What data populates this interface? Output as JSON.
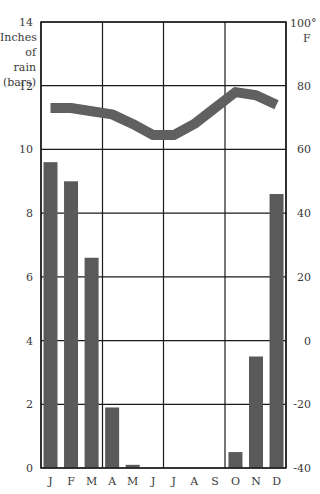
{
  "chart_data": {
    "type": "bar+line",
    "title": "",
    "categories": [
      "J",
      "F",
      "M",
      "A",
      "M",
      "J",
      "J",
      "A",
      "S",
      "O",
      "N",
      "D"
    ],
    "series": [
      {
        "name": "Inches of rain (bars)",
        "type": "bar",
        "axis": "left",
        "values": [
          9.6,
          9.0,
          6.6,
          1.9,
          0.1,
          0,
          0,
          0,
          0,
          0.5,
          3.5,
          8.6
        ]
      },
      {
        "name": "Temperature °F",
        "type": "line",
        "axis": "right",
        "values": [
          73,
          73,
          72,
          71,
          68,
          64.5,
          64.5,
          68,
          73,
          78,
          77,
          74
        ]
      }
    ],
    "left_axis": {
      "label_lines": [
        "Inches",
        "of rain",
        "(bars)"
      ],
      "ylim": [
        0,
        14
      ],
      "ticks": [
        "0",
        "2",
        "4",
        "6",
        "8",
        "10",
        "12",
        "14"
      ]
    },
    "right_axis": {
      "label_top": "100°",
      "label_unit": "F",
      "ylim": [
        -40,
        100
      ],
      "ticks": [
        "-40",
        "-20",
        "0",
        "20",
        "40",
        "60",
        "80"
      ]
    },
    "grid": true,
    "legend": "none",
    "colors": {
      "bar": "#5a5a5a",
      "line": "#606060",
      "grid": "#1a1a1a"
    }
  }
}
